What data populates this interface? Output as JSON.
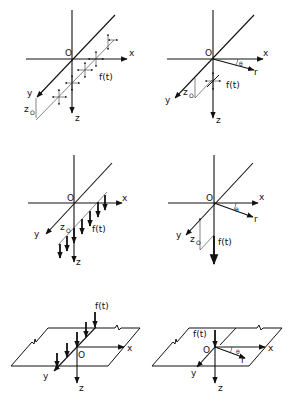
{
  "figure": {
    "panels": [
      {
        "id": "a",
        "description": "Line load along y-direction at depth z0, with forces in all directions (x, y, z)",
        "labels": {
          "origin": "O",
          "x": "x",
          "y": "y",
          "z": "z",
          "depth": "z",
          "depth_sub": "O",
          "force": "f(t)"
        }
      },
      {
        "id": "b",
        "description": "Point load at depth z0, cylindrical coordinates",
        "labels": {
          "origin": "O",
          "x": "x",
          "y": "y",
          "z": "z",
          "r": "r",
          "theta": "θ",
          "depth": "z",
          "depth_sub": "O",
          "force": "f(t)"
        }
      },
      {
        "id": "c",
        "description": "Vertical line load along y-direction at depth z0",
        "labels": {
          "origin": "O",
          "x": "x",
          "y": "y",
          "z": "z",
          "depth": "z",
          "depth_sub": "O",
          "force": "f(t)"
        }
      },
      {
        "id": "d",
        "description": "Vertical point load at depth z0, cylindrical coordinates",
        "labels": {
          "origin": "O",
          "x": "x",
          "y": "y",
          "z": "z",
          "r": "r",
          "theta": "θ",
          "depth": "z",
          "depth_sub": "O",
          "force": "f(t)"
        }
      },
      {
        "id": "e",
        "description": "Vertical line load on surface of half-space along y-axis",
        "labels": {
          "origin": "O",
          "x": "x",
          "y": "y",
          "z": "z",
          "force": "f(t)"
        }
      },
      {
        "id": "f",
        "description": "Vertical point load on surface of half-space",
        "labels": {
          "origin": "O",
          "x": "x",
          "y": "y",
          "z": "z",
          "r": "r",
          "theta": "θ",
          "force": "f(t)"
        }
      }
    ]
  }
}
